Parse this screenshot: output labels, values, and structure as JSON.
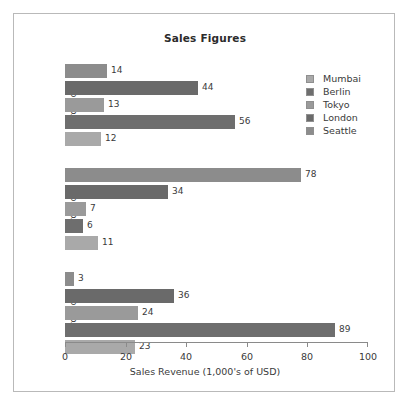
{
  "chart_data": {
    "type": "bar",
    "orientation": "horizontal",
    "title": "Sales Figures",
    "xlabel": "Sales Revenue (1,000's of USD)",
    "ylabel": "",
    "xlim": [
      0,
      100
    ],
    "xticks": [
      0,
      20,
      40,
      60,
      80,
      100
    ],
    "grid": false,
    "legend_position": "upper right",
    "categories": [
      "ProductA",
      "ProductB",
      "ProductC"
    ],
    "series": [
      {
        "name": "Mumbai",
        "color": "#a9a9a9",
        "values": [
          23,
          11,
          12
        ]
      },
      {
        "name": "Berlin",
        "color": "#6e6e6e",
        "values": [
          89,
          6,
          56
        ]
      },
      {
        "name": "Tokyo",
        "color": "#9a9a9a",
        "values": [
          24,
          7,
          13
        ]
      },
      {
        "name": "London",
        "color": "#6a6a6a",
        "values": [
          36,
          34,
          44
        ]
      },
      {
        "name": "Seattle",
        "color": "#8c8c8c",
        "values": [
          3,
          78,
          14
        ]
      }
    ]
  },
  "figure": {
    "title": "Sales Figures",
    "x_axis_title": "Sales Revenue (1,000's of USD)",
    "x_tick_labels": [
      "0",
      "20",
      "40",
      "60",
      "80",
      "100"
    ],
    "group_labels": [
      "ProductC",
      "ProductB",
      "ProductA"
    ]
  },
  "legend": {
    "items": [
      {
        "label": "Mumbai",
        "color": "#a9a9a9"
      },
      {
        "label": "Berlin",
        "color": "#6e6e6e"
      },
      {
        "label": "Tokyo",
        "color": "#9a9a9a"
      },
      {
        "label": "London",
        "color": "#6a6a6a"
      },
      {
        "label": "Seattle",
        "color": "#8c8c8c"
      }
    ]
  },
  "groups": [
    {
      "label": "ProductC",
      "bars": [
        {
          "series": "Seattle",
          "value": 14,
          "label": "14",
          "color": "#8c8c8c"
        },
        {
          "series": "London",
          "value": 44,
          "label": "44",
          "color": "#6a6a6a"
        },
        {
          "series": "Tokyo",
          "value": 13,
          "label": "13",
          "color": "#9a9a9a"
        },
        {
          "series": "Berlin",
          "value": 56,
          "label": "56",
          "color": "#6e6e6e"
        },
        {
          "series": "Mumbai",
          "value": 12,
          "label": "12",
          "color": "#a9a9a9"
        }
      ]
    },
    {
      "label": "ProductB",
      "bars": [
        {
          "series": "Seattle",
          "value": 78,
          "label": "78",
          "color": "#8c8c8c"
        },
        {
          "series": "London",
          "value": 34,
          "label": "34",
          "color": "#6a6a6a"
        },
        {
          "series": "Tokyo",
          "value": 7,
          "label": "7",
          "color": "#9a9a9a"
        },
        {
          "series": "Berlin",
          "value": 6,
          "label": "6",
          "color": "#6e6e6e"
        },
        {
          "series": "Mumbai",
          "value": 11,
          "label": "11",
          "color": "#a9a9a9"
        }
      ]
    },
    {
      "label": "ProductA",
      "bars": [
        {
          "series": "Seattle",
          "value": 3,
          "label": "3",
          "color": "#8c8c8c"
        },
        {
          "series": "London",
          "value": 36,
          "label": "36",
          "color": "#6a6a6a"
        },
        {
          "series": "Tokyo",
          "value": 24,
          "label": "24",
          "color": "#9a9a9a"
        },
        {
          "series": "Berlin",
          "value": 89,
          "label": "89",
          "color": "#6e6e6e"
        },
        {
          "series": "Mumbai",
          "value": 23,
          "label": "23",
          "color": "#a9a9a9"
        }
      ]
    }
  ]
}
